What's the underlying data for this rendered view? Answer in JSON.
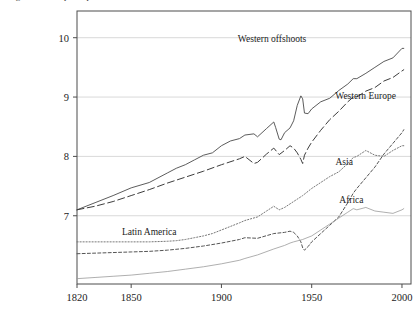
{
  "figure": {
    "clipped_caption": "Figure 1. GDP per capita",
    "background": "#ffffff",
    "plot_border_color": "#4d4d4d",
    "gridline_color": "#d9d9d9"
  },
  "axes": {
    "x": {
      "label": "",
      "ticks": [
        "1820",
        "1850",
        "1900",
        "1950",
        "2000"
      ],
      "tick_values": [
        1820,
        1850,
        1900,
        1950,
        2000
      ],
      "range": [
        1820,
        2005
      ]
    },
    "y": {
      "label": "",
      "ticks": [
        "7",
        "8",
        "9",
        "10"
      ],
      "tick_values": [
        7,
        8,
        9,
        10
      ],
      "range": [
        5.85,
        10.45
      ],
      "gridlines": [
        7,
        8,
        9,
        10
      ]
    }
  },
  "series_labels": {
    "western_offshoots": "Western offshoots",
    "western_europe": "Western Europe",
    "asia": "Asia",
    "africa": "Africa",
    "latin_america": "Latin America"
  },
  "chart_data": {
    "type": "line",
    "title": "Figure 1. GDP per capita",
    "xlabel": "",
    "ylabel": "",
    "xlim": [
      1820,
      2005
    ],
    "ylim": [
      5.85,
      10.45
    ],
    "grid": true,
    "legend_position": "inline-annotations",
    "series": [
      {
        "name": "Western offshoots",
        "style": "solid",
        "color": "#4a4a4a",
        "label_xy": [
          1928,
          9.93
        ],
        "x": [
          1820,
          1830,
          1840,
          1850,
          1860,
          1870,
          1875,
          1880,
          1885,
          1890,
          1895,
          1900,
          1905,
          1910,
          1913,
          1918,
          1920,
          1925,
          1929,
          1930,
          1932,
          1933,
          1935,
          1938,
          1940,
          1942,
          1944,
          1945,
          1946,
          1948,
          1950,
          1955,
          1960,
          1965,
          1970,
          1973,
          1975,
          1980,
          1985,
          1990,
          1995,
          2000,
          2001
        ],
        "y": [
          7.1,
          7.22,
          7.34,
          7.47,
          7.56,
          7.72,
          7.8,
          7.86,
          7.94,
          8.02,
          8.06,
          8.18,
          8.26,
          8.3,
          8.36,
          8.38,
          8.33,
          8.47,
          8.58,
          8.49,
          8.29,
          8.28,
          8.4,
          8.48,
          8.6,
          8.86,
          9.02,
          8.97,
          8.73,
          8.72,
          8.8,
          8.92,
          8.98,
          9.11,
          9.22,
          9.31,
          9.31,
          9.4,
          9.5,
          9.6,
          9.66,
          9.82,
          9.82
        ]
      },
      {
        "name": "Western Europe",
        "style": "dashed",
        "color": "#3d3d3d",
        "label_xy": [
          1963,
          8.97
        ],
        "x": [
          1820,
          1830,
          1840,
          1850,
          1860,
          1870,
          1880,
          1890,
          1900,
          1910,
          1913,
          1918,
          1920,
          1925,
          1929,
          1932,
          1935,
          1938,
          1940,
          1942,
          1944,
          1945,
          1946,
          1948,
          1950,
          1955,
          1960,
          1965,
          1970,
          1973,
          1975,
          1980,
          1985,
          1990,
          1995,
          2000,
          2001
        ],
        "y": [
          7.1,
          7.16,
          7.24,
          7.34,
          7.44,
          7.55,
          7.65,
          7.75,
          7.86,
          7.96,
          8.0,
          7.88,
          7.9,
          8.04,
          8.14,
          8.03,
          8.1,
          8.18,
          8.14,
          8.06,
          7.95,
          7.88,
          8.02,
          8.14,
          8.24,
          8.44,
          8.62,
          8.76,
          8.92,
          9.0,
          9.0,
          9.1,
          9.16,
          9.27,
          9.33,
          9.44,
          9.46
        ]
      },
      {
        "name": "Asia",
        "style": "dashed-fine",
        "color": "#555555",
        "label_xy": [
          1968,
          7.86
        ],
        "x": [
          1820,
          1830,
          1840,
          1850,
          1860,
          1870,
          1880,
          1890,
          1900,
          1910,
          1913,
          1920,
          1929,
          1935,
          1938,
          1940,
          1942,
          1944,
          1945,
          1946,
          1948,
          1950,
          1955,
          1960,
          1965,
          1970,
          1973,
          1975,
          1980,
          1985,
          1990,
          1995,
          2000,
          2001
        ],
        "y": [
          6.36,
          6.37,
          6.38,
          6.39,
          6.4,
          6.42,
          6.45,
          6.49,
          6.54,
          6.6,
          6.63,
          6.62,
          6.7,
          6.72,
          6.74,
          6.72,
          6.66,
          6.56,
          6.46,
          6.42,
          6.48,
          6.56,
          6.7,
          6.84,
          6.98,
          7.22,
          7.38,
          7.46,
          7.64,
          7.82,
          8.04,
          8.22,
          8.4,
          8.45
        ]
      },
      {
        "name": "Africa",
        "style": "solid-thin",
        "color": "#9a9a9a",
        "label_xy": [
          1972,
          7.22
        ],
        "x": [
          1820,
          1830,
          1840,
          1850,
          1860,
          1870,
          1880,
          1890,
          1900,
          1910,
          1913,
          1920,
          1929,
          1935,
          1938,
          1940,
          1945,
          1950,
          1955,
          1960,
          1965,
          1970,
          1973,
          1975,
          1980,
          1985,
          1990,
          1995,
          2000,
          2001
        ],
        "y": [
          5.94,
          5.96,
          5.98,
          6.0,
          6.03,
          6.06,
          6.1,
          6.14,
          6.19,
          6.25,
          6.28,
          6.34,
          6.44,
          6.5,
          6.54,
          6.56,
          6.6,
          6.66,
          6.76,
          6.86,
          6.96,
          7.06,
          7.12,
          7.1,
          7.14,
          7.08,
          7.06,
          7.04,
          7.1,
          7.12
        ]
      },
      {
        "name": "Latin America",
        "style": "dotted",
        "color": "#777777",
        "label_xy": [
          1860,
          6.68
        ],
        "x": [
          1820,
          1830,
          1840,
          1850,
          1860,
          1870,
          1875,
          1880,
          1885,
          1890,
          1895,
          1900,
          1905,
          1910,
          1913,
          1920,
          1925,
          1929,
          1932,
          1935,
          1938,
          1940,
          1945,
          1950,
          1955,
          1960,
          1965,
          1970,
          1973,
          1975,
          1980,
          1985,
          1990,
          1995,
          2000,
          2001
        ],
        "y": [
          6.56,
          6.56,
          6.56,
          6.56,
          6.56,
          6.57,
          6.58,
          6.6,
          6.63,
          6.66,
          6.7,
          6.76,
          6.82,
          6.88,
          6.92,
          6.98,
          7.08,
          7.16,
          7.1,
          7.14,
          7.2,
          7.24,
          7.34,
          7.46,
          7.56,
          7.66,
          7.74,
          7.88,
          7.98,
          8.0,
          8.1,
          8.02,
          8.0,
          8.1,
          8.18,
          8.18
        ]
      }
    ]
  }
}
